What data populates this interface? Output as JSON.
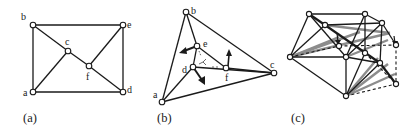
{
  "figure": {
    "panels": [
      {
        "id": "a",
        "caption": "(a)",
        "nodes": [
          {
            "label": "a",
            "x": 33,
            "y": 92
          },
          {
            "label": "b",
            "x": 33,
            "y": 25
          },
          {
            "label": "c",
            "x": 68,
            "y": 51
          },
          {
            "label": "d",
            "x": 123,
            "y": 92
          },
          {
            "label": "e",
            "x": 123,
            "y": 25
          },
          {
            "label": "f",
            "x": 89,
            "y": 66
          }
        ],
        "edges": [
          [
            "a",
            "b"
          ],
          [
            "b",
            "e"
          ],
          [
            "e",
            "d"
          ],
          [
            "d",
            "a"
          ],
          [
            "b",
            "c"
          ],
          [
            "c",
            "f"
          ],
          [
            "f",
            "d"
          ],
          [
            "a",
            "c"
          ],
          [
            "f",
            "e"
          ]
        ]
      },
      {
        "id": "b",
        "caption": "(b)",
        "nodes": [
          {
            "label": "a",
            "x": 162,
            "y": 102
          },
          {
            "label": "b",
            "x": 186,
            "y": 12
          },
          {
            "label": "c",
            "x": 274,
            "y": 73
          },
          {
            "label": "d",
            "x": 193,
            "y": 67
          },
          {
            "label": "e",
            "x": 197,
            "y": 46
          },
          {
            "label": "f",
            "x": 226,
            "y": 68
          }
        ],
        "edges": [
          [
            "a",
            "b"
          ],
          [
            "b",
            "c"
          ],
          [
            "c",
            "a"
          ],
          [
            "b",
            "e"
          ],
          [
            "e",
            "d"
          ],
          [
            "d",
            "a"
          ],
          [
            "e",
            "f"
          ],
          [
            "f",
            "c"
          ],
          [
            "d",
            "c"
          ]
        ],
        "force_arrows": [
          "e-left",
          "d-down-right",
          "f-up"
        ]
      },
      {
        "id": "c",
        "caption": "(c)"
      }
    ]
  }
}
